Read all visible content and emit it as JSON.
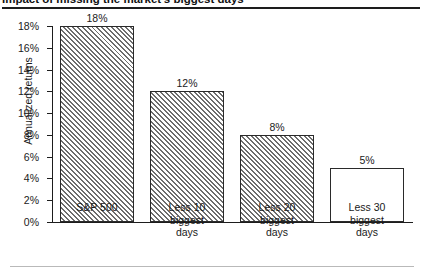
{
  "title": "Impact of missing the market's biggest days",
  "rules": {
    "top_visible": true,
    "bottom_visible": true
  },
  "chart_data": {
    "type": "bar",
    "title": "Impact of missing the market's biggest days",
    "xlabel": "",
    "ylabel": "Annualized returns",
    "ylim": [
      0,
      18
    ],
    "grid": false,
    "legend": null,
    "ytick_labels": [
      "18%",
      "16%",
      "14%",
      "12%",
      "10%",
      "8%",
      "6%",
      "4%",
      "2%",
      "0%"
    ],
    "ytick_values": [
      18,
      16,
      14,
      12,
      10,
      8,
      6,
      4,
      2,
      0
    ],
    "categories": [
      "S&P 500",
      "Less 10 biggest days",
      "Less 20 biggest days",
      "Less 30 biggest days"
    ],
    "category_lines": [
      [
        "S&P 500"
      ],
      [
        "Less 10",
        "biggest",
        "days"
      ],
      [
        "Less 20",
        "biggest",
        "days"
      ],
      [
        "Less 30",
        "biggest",
        "days"
      ]
    ],
    "values": [
      18,
      12,
      8,
      5
    ],
    "value_labels": [
      "18%",
      "12%",
      "8%",
      "5%"
    ],
    "bar_fills": [
      "hatched",
      "hatched",
      "hatched",
      "solid-white"
    ],
    "colors": {
      "bar_edge": "#2a2a2a",
      "bar_hatch": "#6d6d6d",
      "bar_face": "#ffffff",
      "axis": "#1d1d1d",
      "text": "#1a1a1a",
      "rule_bottom": "#b9b9b9"
    }
  }
}
